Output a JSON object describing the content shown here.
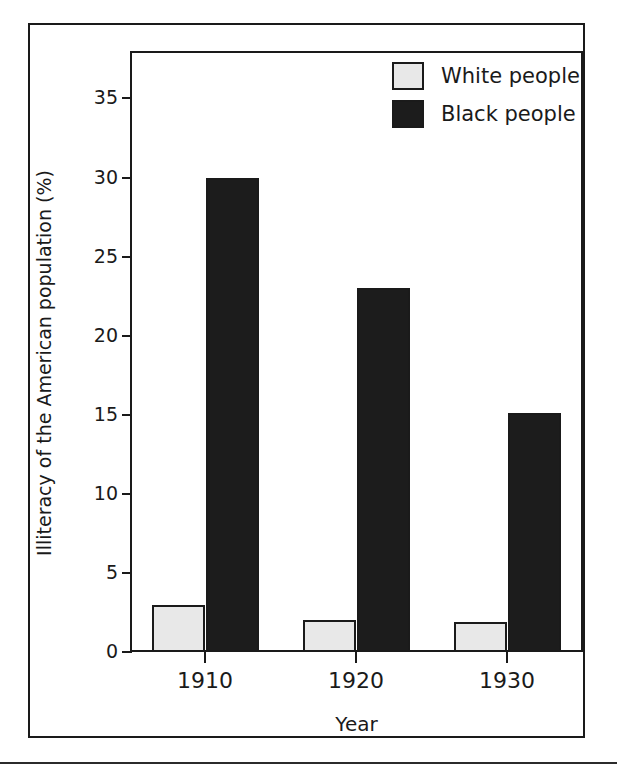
{
  "chart_data": {
    "type": "bar",
    "title": "",
    "subtitle": "",
    "xlabel": "Year",
    "ylabel": "Illiteracy of the American population (%)",
    "categories": [
      "1910",
      "1920",
      "1930"
    ],
    "series": [
      {
        "name": "White people",
        "values": [
          3,
          2,
          1.9
        ],
        "color": "#e8e8e8"
      },
      {
        "name": "Black people",
        "values": [
          30,
          23,
          15.1
        ],
        "color": "#1c1c1c"
      }
    ],
    "ylim": [
      0,
      38
    ],
    "yticks": [
      0,
      5,
      10,
      15,
      20,
      25,
      30,
      35
    ],
    "ytick_labels": [
      "0",
      "5",
      "10",
      "15",
      "20",
      "25",
      "30",
      "35"
    ],
    "xtick_labels": [
      "1910",
      "1920",
      "1930"
    ],
    "grid": false,
    "legend_position": "top-right",
    "legend": [
      {
        "label": "White people",
        "swatch": "light"
      },
      {
        "label": "Black people",
        "swatch": "dark"
      }
    ]
  },
  "figure": {
    "border_color": "#1a1a1a",
    "background": "#ffffff"
  }
}
